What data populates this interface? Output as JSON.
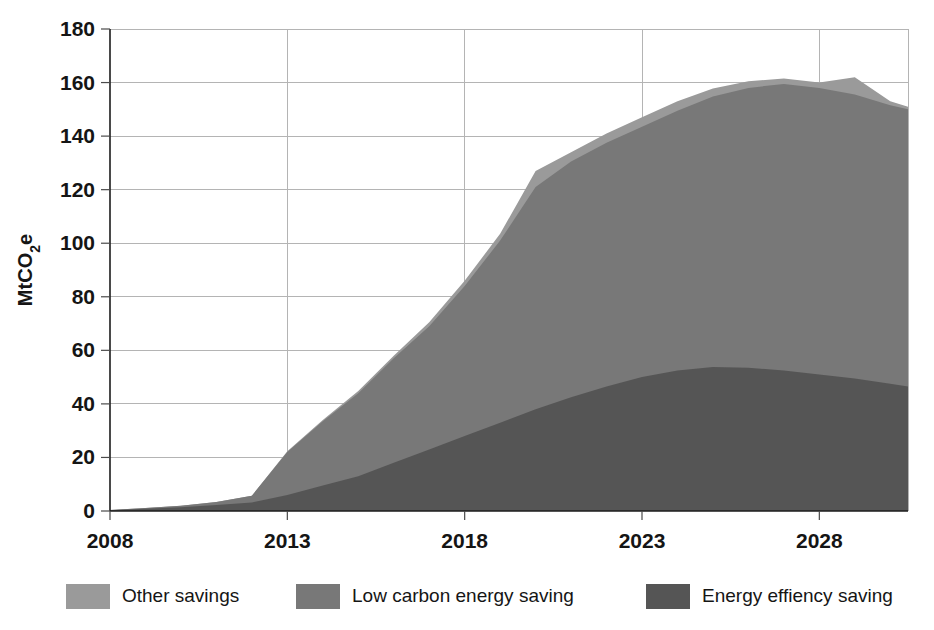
{
  "chart_data": {
    "type": "area",
    "stacked": true,
    "title": "",
    "subtitle": "",
    "xlabel": "",
    "ylabel": "MtCO2e",
    "ylabel_display": "MtCO₂e",
    "xlim": [
      2008,
      2030.5
    ],
    "ylim": [
      0,
      180
    ],
    "grid": true,
    "legend_position": "bottom",
    "y_ticks": [
      0,
      20,
      40,
      60,
      80,
      100,
      120,
      140,
      160,
      180
    ],
    "y_tick_labels": [
      "0",
      "20",
      "40",
      "60",
      "80",
      "100",
      "120",
      "140",
      "160",
      "180"
    ],
    "x_ticks": [
      2008,
      2013,
      2018,
      2023,
      2028
    ],
    "x_tick_labels": [
      "2008",
      "2013",
      "2018",
      "2023",
      "2028"
    ],
    "x": [
      2008,
      2009,
      2010,
      2011,
      2012,
      2013,
      2014,
      2015,
      2016,
      2017,
      2018,
      2019,
      2020,
      2021,
      2022,
      2023,
      2024,
      2025,
      2026,
      2027,
      2028,
      2029,
      2030,
      2030.5
    ],
    "series": [
      {
        "name": "Energy effiency saving",
        "color": "#555555",
        "stack_order": 1,
        "values": [
          0.3,
          0.8,
          1.4,
          2.2,
          3.2,
          6.0,
          9.5,
          13.0,
          18.0,
          23.0,
          28.0,
          33.0,
          38.0,
          42.5,
          46.5,
          50.0,
          52.5,
          53.8,
          53.5,
          52.5,
          51.0,
          49.5,
          47.5,
          46.5
        ]
      },
      {
        "name": "Low carbon energy saving",
        "color": "#787878",
        "stack_order": 2,
        "values": [
          0.1,
          0.3,
          0.6,
          1.2,
          2.5,
          16.0,
          24.0,
          31.0,
          39.0,
          46.0,
          56.0,
          68.0,
          83.0,
          88.0,
          91.0,
          93.5,
          97.0,
          101.0,
          104.5,
          107.0,
          107.0,
          106.0,
          104.0,
          103.5
        ]
      },
      {
        "name": "Other savings",
        "color": "#9a9a9a",
        "stack_order": 3,
        "values": [
          0.0,
          0.0,
          0.0,
          0.0,
          0.0,
          0.3,
          0.5,
          0.8,
          1.0,
          1.5,
          2.0,
          2.5,
          6.0,
          3.5,
          3.5,
          3.5,
          3.5,
          3.0,
          2.5,
          2.0,
          2.0,
          6.5,
          1.5,
          1.0
        ]
      }
    ],
    "totals": [
      0.4,
      1.1,
      2.0,
      3.4,
      5.7,
      22.3,
      34.0,
      44.8,
      58.0,
      70.5,
      86.0,
      103.5,
      127.0,
      134.0,
      141.0,
      147.0,
      153.0,
      157.8,
      160.5,
      161.5,
      160.0,
      162.0,
      153.0,
      151.0
    ]
  },
  "legend": {
    "items": [
      {
        "label": "Other savings",
        "color": "#9a9a9a"
      },
      {
        "label": "Low carbon energy saving",
        "color": "#787878"
      },
      {
        "label": "Energy effiency saving",
        "color": "#555555"
      }
    ]
  },
  "axes": {
    "y_title": "MtCO₂e"
  },
  "colors": {
    "other_savings": "#9a9a9a",
    "low_carbon": "#787878",
    "energy_efficiency": "#555555",
    "grid": "#b4b4b4",
    "axis": "#1c1c1c",
    "text": "#151515",
    "background": "#ffffff"
  }
}
